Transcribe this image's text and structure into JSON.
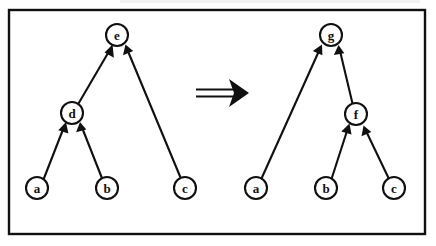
{
  "figure": {
    "canvas": {
      "width": 436,
      "height": 246,
      "background": "#ffffff"
    },
    "frame": {
      "x": 9,
      "y": 10,
      "width": 416,
      "height": 224,
      "stroke": "#101010",
      "stroke_width": 2.4
    },
    "ink_color": "#101010",
    "node_radius": 11,
    "rewrite_arrow": {
      "name": "double-line-rightwards-arrow",
      "glyph": "⟹",
      "label": "",
      "x1": 196,
      "y1": 93,
      "x2": 232,
      "y2": 93,
      "tip_x": 246
    },
    "panels": [
      {
        "id": "lhs",
        "name": "left-graph-panel",
        "caption": "",
        "nodes": [
          {
            "id": "e",
            "label": "e",
            "cx": 117,
            "cy": 35
          },
          {
            "id": "d",
            "label": "d",
            "cx": 72,
            "cy": 113
          },
          {
            "id": "a",
            "label": "a",
            "cx": 37,
            "cy": 188
          },
          {
            "id": "b",
            "label": "b",
            "cx": 107,
            "cy": 188
          },
          {
            "id": "c",
            "label": "c",
            "cx": 185,
            "cy": 188
          }
        ],
        "edges": [
          {
            "from": "d",
            "to": "e",
            "name": "edge-d-to-e"
          },
          {
            "from": "c",
            "to": "e",
            "name": "edge-c-to-e"
          },
          {
            "from": "a",
            "to": "d",
            "name": "edge-a-to-d"
          },
          {
            "from": "b",
            "to": "d",
            "name": "edge-b-to-d"
          }
        ]
      },
      {
        "id": "rhs",
        "name": "right-graph-panel",
        "caption": "",
        "nodes": [
          {
            "id": "g",
            "label": "g",
            "cx": 331,
            "cy": 35
          },
          {
            "id": "f",
            "label": "f",
            "cx": 356,
            "cy": 114
          },
          {
            "id": "a",
            "label": "a",
            "cx": 256,
            "cy": 188
          },
          {
            "id": "b",
            "label": "b",
            "cx": 326,
            "cy": 188
          },
          {
            "id": "c",
            "label": "c",
            "cx": 394,
            "cy": 188
          }
        ],
        "edges": [
          {
            "from": "a",
            "to": "g",
            "name": "edge-a-to-g"
          },
          {
            "from": "f",
            "to": "g",
            "name": "edge-f-to-g"
          },
          {
            "from": "b",
            "to": "f",
            "name": "edge-b-to-f"
          },
          {
            "from": "c",
            "to": "f",
            "name": "edge-c-to-f"
          }
        ]
      }
    ]
  }
}
